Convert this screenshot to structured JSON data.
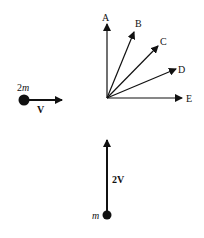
{
  "diagram": {
    "type": "collision-momentum-diagram",
    "particle_left": {
      "mass_label_num": "2",
      "mass_label_var": "m",
      "velocity_label": "V",
      "direction": "right"
    },
    "particle_bottom": {
      "mass_label": "m",
      "velocity_label": "2V",
      "direction": "up"
    },
    "answer_vectors": [
      {
        "label": "A",
        "direction": "up"
      },
      {
        "label": "B",
        "direction": "up-right steep"
      },
      {
        "label": "C",
        "direction": "45 degrees"
      },
      {
        "label": "D",
        "direction": "right shallow"
      },
      {
        "label": "E",
        "direction": "right"
      }
    ],
    "colors": {
      "ink": "#111111",
      "background": "#ffffff"
    }
  }
}
